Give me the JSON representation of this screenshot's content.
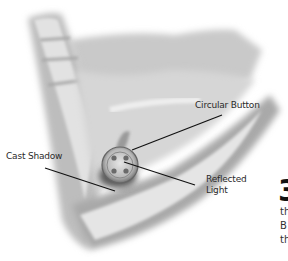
{
  "illustration": {
    "subject": "fabric-fold-with-button",
    "colors": {
      "background": "#ffffff",
      "shading": "#8a8a8a",
      "line": "#111111"
    }
  },
  "labels": {
    "circular_button": "Circular Button",
    "cast_shadow": "Cast Shadow",
    "reflected_light_line1": "Reflected",
    "reflected_light_line2": "Light"
  },
  "cropped_side_text": {
    "big_numeral": "3",
    "lines": [
      "th",
      "B",
      "th"
    ]
  }
}
